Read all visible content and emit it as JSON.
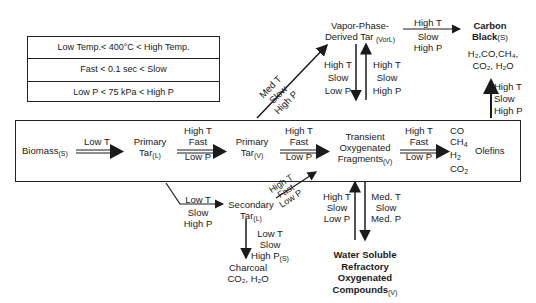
{
  "legend": {
    "rows": [
      "Low Temp.< 400°C < High Temp.",
      "Fast < 0.1 sec < Slow",
      "Low P < 75 kPa < High P"
    ]
  },
  "nodes": {
    "biomass": {
      "name": "Biomass",
      "phase": "(S)"
    },
    "primary_tar_l": {
      "line1": "Primary",
      "line2": "Tar",
      "phase": "(L)"
    },
    "primary_tar_v": {
      "line1": "Primary",
      "line2": "Tar",
      "phase": "(V)"
    },
    "transient": {
      "line1": "Transient",
      "line2": "Oxygenated",
      "line3": "Fragments",
      "phase": "(V)"
    },
    "gases": {
      "l1": "CO",
      "l2": "CH",
      "l2sub": "4",
      "l3": "H",
      "l3sub": "2",
      "l4": "CO",
      "l4sub": "2"
    },
    "olefins": {
      "name": "Olefins"
    },
    "vapor_tar": {
      "line1": "Vapor-Phase-",
      "line2": "Derived Tar",
      "phase": "(VorL)"
    },
    "carbon_black": {
      "line1": "Carbon",
      "line2": "Black",
      "phase": "(S)",
      "products1": "H₂,CO,CH₄,",
      "products2": "CO₂, H₂O"
    },
    "secondary_tar": {
      "line1": "Secondary",
      "line2": "Tar",
      "phase": "(L)"
    },
    "charcoal": {
      "name": "Charcoal",
      "products": "CO₂, H₂O"
    },
    "water_soluble": {
      "line1": "Water Soluble",
      "line2": "Refractory",
      "line3": "Oxygenated",
      "line4": "Compounds",
      "phase": "(V)"
    }
  },
  "conditions": {
    "biomass_to_primary_l": {
      "top": "Low T"
    },
    "primary_l_to_v": {
      "top1": "High T",
      "top2": "Fast",
      "bottom": "Low P"
    },
    "primary_v_to_transient": {
      "top1": "High T",
      "top2": "Fast",
      "bottom": "Low P"
    },
    "transient_to_gases": {
      "top1": "High T",
      "top2": "Fast",
      "bottom": "Low P"
    },
    "primary_v_to_vapor_tar": {
      "l1": "Med T",
      "l2": "Slow",
      "l3": "High P"
    },
    "vapor_tar_down": {
      "l1": "High T",
      "l2": "Slow",
      "l3": "Low P"
    },
    "vapor_tar_up": {
      "l1": "High T",
      "l2": "Slow",
      "l3": "High P"
    },
    "vapor_tar_to_carbon": {
      "top": "High T",
      "b1": "Slow",
      "b2": "High P"
    },
    "gases_to_carbon": {
      "l1": "High T",
      "l2": "Slow",
      "l3": "High P"
    },
    "primary_l_to_secondary": {
      "top": "Low T",
      "b1": "Slow",
      "b2": "High P"
    },
    "secondary_to_transient": {
      "l1": "High T",
      "l2": "Fast",
      "l3": "Low P"
    },
    "secondary_to_charcoal": {
      "l1": "Low T",
      "l2": "Slow",
      "l3": "High P",
      "phase": "(S)"
    },
    "water_to_transient": {
      "l1": "High T",
      "l2": "Slow",
      "l3": "Low P"
    },
    "transient_to_water": {
      "l1": "Med. T",
      "l2": "Slow",
      "l3": "Med. P"
    }
  }
}
